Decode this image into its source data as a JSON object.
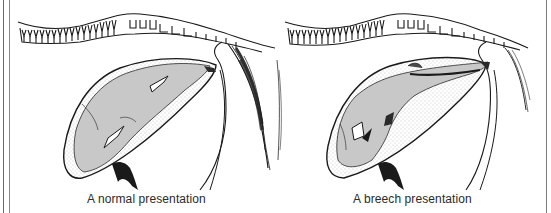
{
  "figure": {
    "panels": [
      {
        "id": "normal",
        "caption": "A normal presentation",
        "description": "Foal in uterus, head and forelegs toward birth canal"
      },
      {
        "id": "breech",
        "caption": "A breech presentation",
        "description": "Foal in uterus, hindquarters toward birth canal"
      }
    ],
    "colors": {
      "line": "#1a1a1a",
      "foal_fill": "#c8c8c8",
      "stipple": "#9a9a9a",
      "background": "#ffffff"
    }
  }
}
